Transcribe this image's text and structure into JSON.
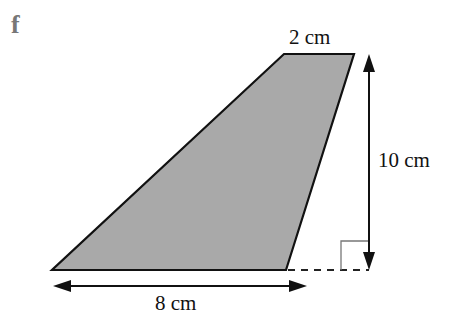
{
  "figure": {
    "part_letter": "f",
    "shape": "trapezium",
    "fill_color": "#a9a9a9",
    "stroke_color": "#111111",
    "labels": {
      "top_side": "2 cm",
      "height": "10 cm",
      "base": "8 cm"
    },
    "measurements": {
      "top_cm": 2,
      "height_cm": 10,
      "base_cm": 8
    },
    "annotations": [
      "right-angle-marker",
      "dashed-extension-line",
      "double-headed-arrows"
    ]
  }
}
